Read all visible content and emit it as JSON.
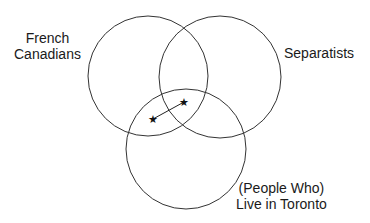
{
  "diagram": {
    "type": "venn",
    "sets": [
      {
        "name": "french-canadians",
        "label_line1": "French",
        "label_line2": "Canadians",
        "cx": 148,
        "cy": 76,
        "r": 60
      },
      {
        "name": "separatists",
        "label_line1": "Separatists",
        "cx": 220,
        "cy": 77,
        "r": 61
      },
      {
        "name": "live-in-toronto",
        "label_line1": "(People Who)",
        "label_line2": "Live in Toronto",
        "cx": 186,
        "cy": 149,
        "r": 60
      }
    ],
    "points": [
      {
        "symbol": "★",
        "x": 153,
        "y": 119
      },
      {
        "symbol": "★",
        "x": 184,
        "y": 102
      }
    ],
    "stroke_color": "#333333"
  }
}
